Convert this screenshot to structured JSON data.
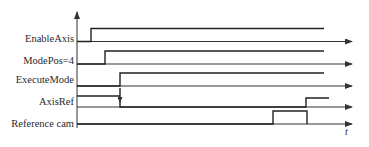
{
  "diagram": {
    "type": "timing-diagram",
    "time_axis_label": "t",
    "signals": [
      {
        "name": "EnableAxis",
        "label": "EnableAxis",
        "rise_x": 91,
        "fall_x": null
      },
      {
        "name": "ModePos",
        "label": "ModePos=4",
        "rise_x": 105,
        "fall_x": null
      },
      {
        "name": "ExecuteMode",
        "label": "ExecuteMode",
        "rise_x": 120,
        "fall_x": null
      },
      {
        "name": "AxisRef",
        "label": "AxisRef",
        "initial_level": "high-ref",
        "drop_x": 120,
        "rise_x": 306
      },
      {
        "name": "ReferenceCam",
        "label": "Reference cam",
        "pulse_start_x": 273,
        "pulse_end_x": 307
      }
    ]
  },
  "colors": {
    "line": "#333333",
    "text": "#2a2a2a",
    "background": "#ffffff"
  }
}
